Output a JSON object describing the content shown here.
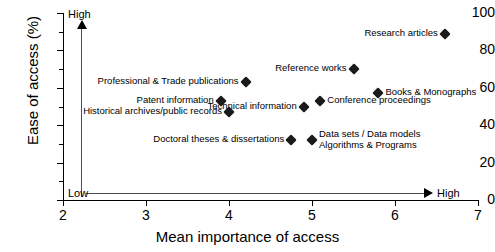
{
  "chart_data": {
    "type": "scatter",
    "title": "",
    "xlabel": "Mean importance of access",
    "ylabel": "Ease of access (%)",
    "xlim": [
      2,
      7
    ],
    "ylim": [
      0,
      100
    ],
    "xticks": [
      "2",
      "3",
      "4",
      "5",
      "6",
      "7"
    ],
    "yticks": [
      "0",
      "20",
      "40",
      "60",
      "80",
      "100"
    ],
    "grid": false,
    "legend": "none",
    "axis_annotations": {
      "y_high": "High",
      "x_low": "Low",
      "x_high": "High"
    },
    "points": [
      {
        "label": "Research articles",
        "x": 6.6,
        "y": 89,
        "label_side": "left"
      },
      {
        "label": "Reference works",
        "x": 5.5,
        "y": 70,
        "label_side": "left"
      },
      {
        "label": "Professional & Trade publications",
        "x": 4.2,
        "y": 63,
        "label_side": "left"
      },
      {
        "label": "Books & Monographs",
        "x": 5.8,
        "y": 57,
        "label_side": "right"
      },
      {
        "label": "Conference proceedings",
        "x": 5.1,
        "y": 53,
        "label_side": "right"
      },
      {
        "label": "Technical information",
        "x": 4.9,
        "y": 50,
        "label_side": "left"
      },
      {
        "label": "Patent information",
        "x": 3.9,
        "y": 53,
        "label_side": "left"
      },
      {
        "label": "Historical archives/public records",
        "x": 4.0,
        "y": 47,
        "label_side": "left"
      },
      {
        "label": "Doctoral theses & dissertations",
        "x": 4.75,
        "y": 32,
        "label_side": "left"
      },
      {
        "label": "Data sets / Data models\nAlgorithms & Programs",
        "x": 5.0,
        "y": 32,
        "label_side": "right-two"
      }
    ]
  }
}
